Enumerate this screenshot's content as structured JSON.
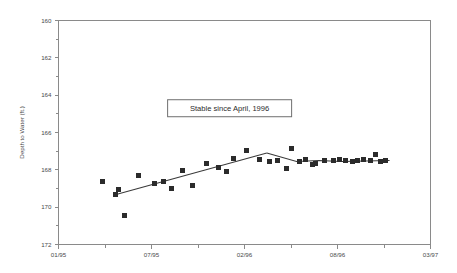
{
  "chart_data": {
    "type": "scatter",
    "title": "",
    "xlabel": "",
    "ylabel": "Depth to Water (ft.)",
    "grid": false,
    "legend": null,
    "y_axis_inverted": true,
    "ylim": [
      160,
      172
    ],
    "y_ticks": [
      160,
      162,
      164,
      166,
      168,
      170,
      172
    ],
    "y_tick_labels": [
      "160",
      "162",
      "164",
      "166",
      "168",
      "170",
      "172"
    ],
    "y_minor_ticks_per_interval": 1,
    "x_ticks": [
      "01/95",
      "07/95",
      "02/96",
      "08/96",
      "03/97"
    ],
    "x_tick_labels": [
      "01/95",
      "07/95",
      "02/96",
      "08/96",
      "03/97"
    ],
    "x_minor_ticks_per_interval": 1,
    "xlim_labels": [
      "01/95",
      "03/97"
    ],
    "annotations": [
      {
        "text": "Stable since April, 1996",
        "x_frac": 0.46,
        "y_value": 164.7,
        "boxed": true
      }
    ],
    "series": [
      {
        "name": "Depth to Water observations",
        "marker": "square",
        "marker_color": "#2b2b2b",
        "marker_size_px": 5,
        "points": [
          {
            "x_frac": 0.118,
            "y": 168.65
          },
          {
            "x_frac": 0.152,
            "y": 169.3
          },
          {
            "x_frac": 0.16,
            "y": 169.05
          },
          {
            "x_frac": 0.178,
            "y": 170.45
          },
          {
            "x_frac": 0.215,
            "y": 168.3
          },
          {
            "x_frac": 0.258,
            "y": 168.75
          },
          {
            "x_frac": 0.282,
            "y": 168.65
          },
          {
            "x_frac": 0.303,
            "y": 169.0
          },
          {
            "x_frac": 0.333,
            "y": 168.05
          },
          {
            "x_frac": 0.36,
            "y": 168.85
          },
          {
            "x_frac": 0.398,
            "y": 167.65
          },
          {
            "x_frac": 0.43,
            "y": 167.9
          },
          {
            "x_frac": 0.452,
            "y": 168.1
          },
          {
            "x_frac": 0.47,
            "y": 167.4
          },
          {
            "x_frac": 0.505,
            "y": 166.95
          },
          {
            "x_frac": 0.54,
            "y": 167.45
          },
          {
            "x_frac": 0.568,
            "y": 167.55
          },
          {
            "x_frac": 0.59,
            "y": 167.5
          },
          {
            "x_frac": 0.612,
            "y": 167.95
          },
          {
            "x_frac": 0.625,
            "y": 166.85
          },
          {
            "x_frac": 0.648,
            "y": 167.55
          },
          {
            "x_frac": 0.665,
            "y": 167.45
          },
          {
            "x_frac": 0.682,
            "y": 167.7
          },
          {
            "x_frac": 0.692,
            "y": 167.65
          },
          {
            "x_frac": 0.715,
            "y": 167.5
          },
          {
            "x_frac": 0.738,
            "y": 167.5
          },
          {
            "x_frac": 0.755,
            "y": 167.45
          },
          {
            "x_frac": 0.772,
            "y": 167.5
          },
          {
            "x_frac": 0.79,
            "y": 167.55
          },
          {
            "x_frac": 0.805,
            "y": 167.5
          },
          {
            "x_frac": 0.82,
            "y": 167.45
          },
          {
            "x_frac": 0.838,
            "y": 167.5
          },
          {
            "x_frac": 0.852,
            "y": 167.2
          },
          {
            "x_frac": 0.866,
            "y": 167.55
          },
          {
            "x_frac": 0.88,
            "y": 167.5
          }
        ]
      }
    ],
    "trend_segments": [
      {
        "name": "rising-trend",
        "points": [
          {
            "x_frac": 0.15,
            "y": 169.35
          },
          {
            "x_frac": 0.56,
            "y": 167.1
          }
        ]
      },
      {
        "name": "stable-trend",
        "points": [
          {
            "x_frac": 0.56,
            "y": 167.1
          },
          {
            "x_frac": 0.64,
            "y": 167.55
          },
          {
            "x_frac": 0.7,
            "y": 167.5
          },
          {
            "x_frac": 0.76,
            "y": 167.55
          },
          {
            "x_frac": 0.89,
            "y": 167.5
          }
        ]
      }
    ]
  },
  "colors": {
    "background": "#ffffff",
    "axis": "#8a8a8a",
    "marker": "#2b2b2b",
    "trend": "#3a3a3a",
    "text": "#4a4a4a",
    "annotation_border": "#6f6f6f"
  }
}
